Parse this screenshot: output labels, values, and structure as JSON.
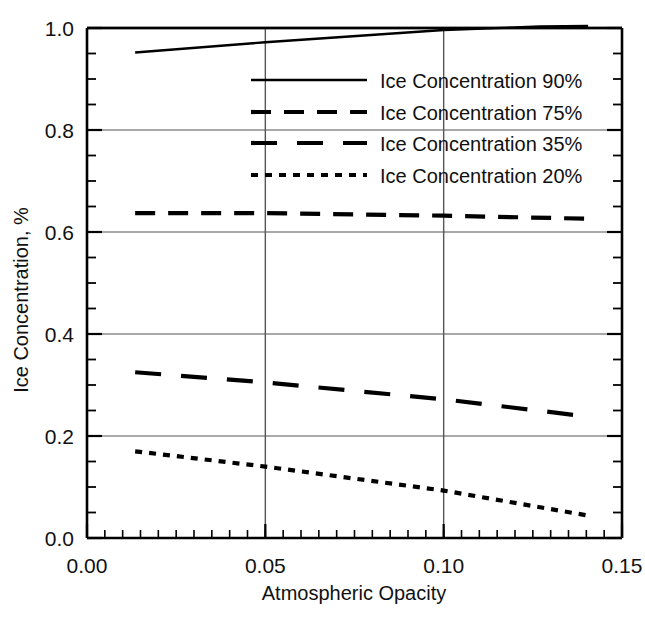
{
  "chart_data": {
    "type": "line",
    "title": "",
    "xlabel": "Atmospheric Opacity",
    "ylabel": "Ice Concentration, %",
    "xlim": [
      0.0,
      0.15
    ],
    "ylim": [
      0.0,
      1.0
    ],
    "xticks": [
      0.0,
      0.05,
      0.1,
      0.15
    ],
    "xtick_labels": [
      "0.00",
      "0.05",
      "0.10",
      "0.15"
    ],
    "yticks": [
      0.0,
      0.2,
      0.4,
      0.6,
      0.8,
      1.0
    ],
    "ytick_labels": [
      "0.0",
      "0.2",
      "0.4",
      "0.6",
      "0.8",
      "1.0"
    ],
    "xminor_step": 0.005,
    "yminor_step": 0.05,
    "grid": true,
    "grid_axes": "both",
    "legend_position": "upper-center-right",
    "series": [
      {
        "name": "Ice Concentration 90%",
        "style": "solid",
        "x": [
          0.0135,
          0.05,
          0.1,
          0.127,
          0.1405
        ],
        "y": [
          0.952,
          0.972,
          0.996,
          1.003,
          1.004
        ]
      },
      {
        "name": "Ice Concentration 75%",
        "style": "dashed",
        "x": [
          0.0135,
          0.05,
          0.1,
          0.1405
        ],
        "y": [
          0.637,
          0.637,
          0.632,
          0.626
        ]
      },
      {
        "name": "Ice Concentration 35%",
        "style": "longdash",
        "x": [
          0.0135,
          0.05,
          0.1,
          0.1405
        ],
        "y": [
          0.325,
          0.305,
          0.272,
          0.238
        ]
      },
      {
        "name": "Ice Concentration 20%",
        "style": "dotted",
        "x": [
          0.0135,
          0.05,
          0.1,
          0.1405
        ],
        "y": [
          0.17,
          0.14,
          0.093,
          0.044
        ]
      }
    ]
  },
  "legend": {
    "entries": [
      {
        "label": "Ice Concentration 90%",
        "style": "solid"
      },
      {
        "label": "Ice Concentration 75%",
        "style": "dashed"
      },
      {
        "label": "Ice Concentration 35%",
        "style": "longdash"
      },
      {
        "label": "Ice Concentration 20%",
        "style": "dotted"
      }
    ]
  },
  "colors": {
    "line": "#000000",
    "grid": "#555555",
    "axis": "#000000",
    "background": "#ffffff"
  }
}
